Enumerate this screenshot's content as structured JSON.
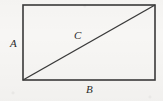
{
  "figure": {
    "kind": "geometry-diagram",
    "background_color": "#f7f6f4",
    "stroke_color": "#3a3a3a",
    "label_color": "#2b2b2b",
    "rectangle": {
      "left": 23,
      "top": 5,
      "right": 155,
      "bottom": 80,
      "width": 132,
      "height": 75,
      "stroke_width": 1.6
    },
    "diagonal": {
      "x1": 23,
      "y1": 80,
      "x2": 155,
      "y2": 5,
      "stroke_width": 1.4
    },
    "labels": {
      "side_left": "A",
      "diagonal": "C",
      "side_bottom": "B"
    }
  }
}
